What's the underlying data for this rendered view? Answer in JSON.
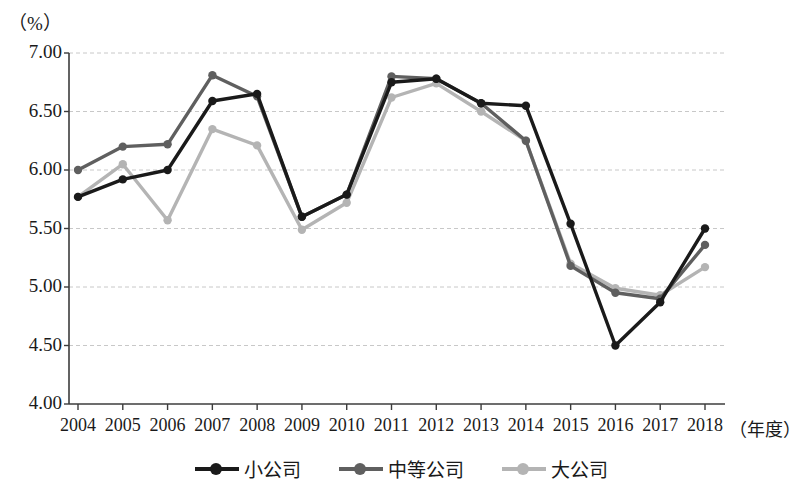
{
  "chart_data": {
    "type": "line",
    "title": "",
    "unit_label": "（%）",
    "xlabel": "（年度）",
    "ylabel": "",
    "categories": [
      "2004",
      "2005",
      "2006",
      "2007",
      "2008",
      "2009",
      "2010",
      "2011",
      "2012",
      "2013",
      "2014",
      "2015",
      "2016",
      "2017",
      "2018"
    ],
    "ylim": [
      4.0,
      7.0
    ],
    "ytick_step": 0.5,
    "ytick_labels": [
      "7.00",
      "6.50",
      "6.00",
      "5.50",
      "5.00",
      "4.50",
      "4.00"
    ],
    "ytick_values": [
      7.0,
      6.5,
      6.0,
      5.5,
      5.0,
      4.5,
      4.0
    ],
    "grid": true,
    "grid_style": "dashed-horizontal",
    "legend_position": "bottom-center",
    "series": [
      {
        "name": "小公司",
        "color": "#1a1a1a",
        "values": [
          5.77,
          5.92,
          6.0,
          6.59,
          6.65,
          5.6,
          5.79,
          6.75,
          6.78,
          6.57,
          6.55,
          5.54,
          4.5,
          4.87,
          5.5
        ]
      },
      {
        "name": "中等公司",
        "color": "#5f5f5f",
        "values": [
          6.0,
          6.2,
          6.22,
          6.81,
          6.63,
          5.6,
          5.79,
          6.8,
          6.78,
          6.57,
          6.25,
          5.18,
          4.95,
          4.9,
          5.36
        ]
      },
      {
        "name": "大公司",
        "color": "#b4b4b4",
        "values": [
          5.77,
          6.05,
          5.57,
          6.35,
          6.21,
          5.49,
          5.72,
          6.62,
          6.74,
          6.5,
          6.25,
          5.2,
          4.99,
          4.93,
          5.17
        ]
      }
    ]
  },
  "legend": {
    "items": [
      {
        "label": "小公司",
        "color": "#1a1a1a",
        "marker": "line-circle-marker"
      },
      {
        "label": "中等公司",
        "color": "#5f5f5f",
        "marker": "line-circle-marker"
      },
      {
        "label": "大公司",
        "color": "#b4b4b4",
        "marker": "line-circle-marker"
      }
    ]
  },
  "axes": {
    "axis_color": "#3c3c3c",
    "grid_color": "#c8c8c8"
  }
}
